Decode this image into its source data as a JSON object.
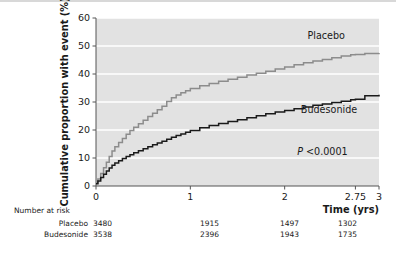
{
  "chart_data": {
    "type": "line",
    "title": "",
    "xlabel": "Time (yrs)",
    "ylabel": "Cumulative proportion with event (%)",
    "xlim": [
      0,
      3
    ],
    "ylim": [
      0,
      60
    ],
    "xticks": [
      "0",
      "1",
      "2",
      "2.75",
      "3"
    ],
    "xtick_values": [
      0,
      1,
      2,
      2.75,
      3
    ],
    "yticks": [
      "0",
      "10",
      "20",
      "30",
      "40",
      "50",
      "60"
    ],
    "ytick_values": [
      0,
      10,
      20,
      30,
      40,
      50,
      60
    ],
    "grid": "horizontal-white",
    "plot_background": "#e2e2e2",
    "legend_position": "inline-annotations",
    "annotations": [
      {
        "text": "Placebo",
        "x": 2.44,
        "y": 52.5
      },
      {
        "text": "Budesonide",
        "x": 2.47,
        "y": 26.0
      },
      {
        "text": "P <0.0001",
        "x": 2.4,
        "y": 11.0
      }
    ],
    "series": [
      {
        "name": "Placebo",
        "color": "#8c8c8c",
        "x": [
          0,
          0.02,
          0.05,
          0.08,
          0.11,
          0.14,
          0.17,
          0.2,
          0.24,
          0.28,
          0.32,
          0.36,
          0.4,
          0.45,
          0.5,
          0.55,
          0.6,
          0.65,
          0.7,
          0.75,
          0.8,
          0.85,
          0.9,
          0.95,
          1.0,
          1.1,
          1.2,
          1.3,
          1.4,
          1.5,
          1.6,
          1.7,
          1.8,
          1.9,
          2.0,
          2.1,
          2.2,
          2.3,
          2.4,
          2.5,
          2.6,
          2.7,
          2.75,
          2.85,
          3.0
        ],
        "y": [
          1.0,
          2.5,
          4.5,
          6.5,
          8.5,
          10.5,
          12.5,
          14.0,
          15.5,
          17.0,
          18.5,
          19.8,
          21.0,
          22.2,
          23.5,
          24.8,
          26.0,
          27.2,
          28.5,
          30.2,
          31.5,
          32.5,
          33.3,
          34.0,
          34.8,
          35.8,
          36.6,
          37.4,
          38.1,
          38.8,
          39.6,
          40.3,
          41.0,
          41.8,
          42.5,
          43.3,
          44.0,
          44.6,
          45.2,
          45.8,
          46.4,
          46.9,
          47.0,
          47.3,
          47.5
        ]
      },
      {
        "name": "Budesonide",
        "color": "#1a1a1a",
        "x": [
          0,
          0.02,
          0.05,
          0.08,
          0.11,
          0.14,
          0.17,
          0.2,
          0.24,
          0.28,
          0.32,
          0.36,
          0.4,
          0.45,
          0.5,
          0.55,
          0.6,
          0.65,
          0.7,
          0.75,
          0.8,
          0.85,
          0.9,
          0.95,
          1.0,
          1.1,
          1.2,
          1.3,
          1.4,
          1.5,
          1.6,
          1.7,
          1.8,
          1.9,
          2.0,
          2.1,
          2.2,
          2.3,
          2.4,
          2.5,
          2.6,
          2.7,
          2.75,
          2.85,
          3.0
        ],
        "y": [
          0.8,
          1.8,
          3.0,
          4.2,
          5.4,
          6.4,
          7.4,
          8.2,
          9.0,
          9.8,
          10.5,
          11.2,
          11.9,
          12.6,
          13.3,
          14.0,
          14.7,
          15.4,
          16.0,
          16.7,
          17.4,
          18.0,
          18.6,
          19.2,
          19.8,
          20.8,
          21.6,
          22.3,
          23.0,
          23.7,
          24.4,
          25.1,
          25.8,
          26.4,
          27.0,
          27.6,
          28.2,
          28.8,
          29.3,
          29.8,
          30.3,
          30.8,
          31.0,
          32.2,
          32.6
        ]
      }
    ]
  },
  "risk_table": {
    "title": "Number at risk",
    "rows": [
      {
        "label": "Placebo",
        "values": [
          "3480",
          "1915",
          "1497",
          "1302"
        ]
      },
      {
        "label": "Budesonide",
        "values": [
          "3538",
          "2396",
          "1943",
          "1735"
        ]
      }
    ]
  },
  "axis": {
    "y_title": "Cumulative proportion with event (%)",
    "x_title": "Time (yrs)"
  }
}
